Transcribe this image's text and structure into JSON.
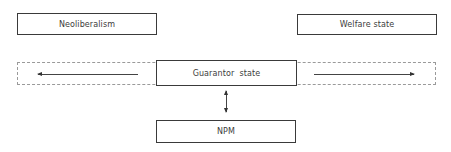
{
  "diagram": {
    "nodes": {
      "neoliberalism": {
        "label": "Neoliberalism"
      },
      "welfare_state": {
        "label": "Welfare state"
      },
      "guarantor_state": {
        "label": "Guarantor  state"
      },
      "npm": {
        "label": "NPM"
      }
    },
    "edges": [
      {
        "from": "guarantor_state",
        "to": "neoliberalism",
        "direction": "left",
        "style": "arrow"
      },
      {
        "from": "guarantor_state",
        "to": "welfare_state",
        "direction": "right",
        "style": "arrow"
      },
      {
        "from": "guarantor_state",
        "to": "npm",
        "direction": "both",
        "style": "double-arrow"
      }
    ],
    "continuum_band": {
      "style": "dashed",
      "spans": [
        "neoliberalism",
        "welfare_state"
      ]
    }
  }
}
